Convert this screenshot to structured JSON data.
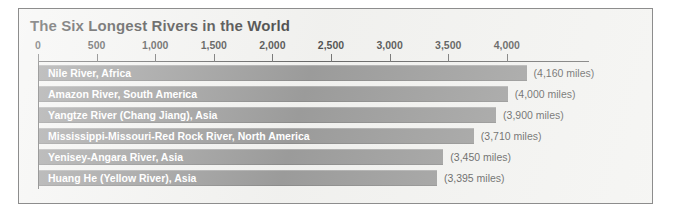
{
  "chart_data": {
    "type": "bar",
    "orientation": "horizontal",
    "title": "The Six Longest Rivers in the World",
    "xlabel": "",
    "ylabel": "",
    "xlim": [
      0,
      4500
    ],
    "grid": false,
    "legend": null,
    "tick_labels": [
      "0",
      "500",
      "1,000",
      "1,500",
      "2,000",
      "2,500",
      "3,000",
      "3,500",
      "4,000"
    ],
    "tick_values": [
      0,
      500,
      1000,
      1500,
      2000,
      2500,
      3000,
      3500,
      4000
    ],
    "categories": [
      "Nile River, Africa",
      "Amazon River, South America",
      "Yangtze River (Chang Jiang), Asia",
      "Mississippi-Missouri-Red Rock River, North America",
      "Yenisey-Angara River, Asia",
      "Huang He (Yellow River), Asia"
    ],
    "values": [
      4160,
      4000,
      3900,
      3710,
      3450,
      3395
    ],
    "value_labels": [
      "(4,160 miles)",
      "(4,000 miles)",
      "(3,900 miles)",
      "(3,710 miles)",
      "(3,450 miles)",
      "(3,395 miles)"
    ],
    "units": "miles",
    "colors": {
      "bar": "#7f7f7f",
      "bar_label_text": "#ffffff",
      "value_label_text": "#1b1b1b",
      "panel_background": "#f1f1ef",
      "panel_border": "#8d8d8d",
      "axis": "#3c3c3c",
      "title_text": "#111111"
    }
  }
}
